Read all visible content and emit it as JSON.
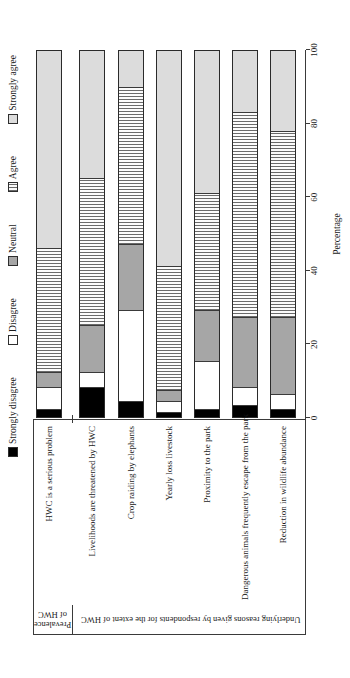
{
  "chart_data": {
    "type": "bar",
    "stacked": true,
    "orientation": "horizontal",
    "rendered_rotation": "figure rotated 90deg counterclockwise in page",
    "title": "",
    "xlabel": "Percentage",
    "xlim": [
      0,
      100
    ],
    "xticks": [
      0,
      20,
      40,
      60,
      80,
      100
    ],
    "grid": false,
    "legend_position": "top",
    "categories": [
      "HWC is a serious problem",
      "Livelihoods are threatened by HWC",
      "Crop raiding by elephants",
      "Yearly loss livestock",
      "Proximity to the park",
      "Dangerous animals frequently escape from the park",
      "Reduction in wildlife abundance"
    ],
    "category_groups": [
      {
        "label_lines": [
          "Prevalence",
          "of HWC"
        ],
        "label": "Prevalence of HWC",
        "category_span": [
          1,
          1
        ]
      },
      {
        "label_lines": [
          "Underlying reasons given by respondents for the extent of HWC"
        ],
        "label": "Underlying reasons given by respondents for the extent of HWC",
        "category_span": [
          2,
          7
        ]
      }
    ],
    "series": [
      {
        "name": "Strongly disagree",
        "fill": "black",
        "color": "#000000",
        "values": [
          2,
          8,
          4,
          1,
          2,
          3,
          2
        ]
      },
      {
        "name": "Disagree",
        "fill": "white",
        "color": "#ffffff",
        "values": [
          6,
          4,
          25,
          3,
          13,
          5,
          4
        ]
      },
      {
        "name": "Neutral",
        "fill": "gray",
        "color": "#a6a6a6",
        "values": [
          4,
          13,
          18,
          3,
          14,
          19,
          21
        ]
      },
      {
        "name": "Agree",
        "fill": "horizontal-hatch",
        "color": "#fbfbfb",
        "hatch_line_color": "#6a6a6a",
        "values": [
          34,
          40,
          43,
          34,
          32,
          56,
          51
        ]
      },
      {
        "name": "Strongly agree",
        "fill": "light-gray",
        "color": "#dcdcdc",
        "values": [
          54,
          35,
          10,
          59,
          39,
          17,
          22
        ]
      }
    ]
  }
}
